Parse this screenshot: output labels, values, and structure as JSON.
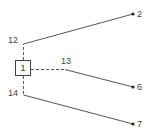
{
  "diagram": {
    "root": {
      "label": "1"
    },
    "branches": [
      {
        "junction_label": "12",
        "end_label": "2"
      },
      {
        "junction_label": "13",
        "end_label": "6"
      },
      {
        "junction_label": "14",
        "end_label": "7"
      }
    ]
  }
}
